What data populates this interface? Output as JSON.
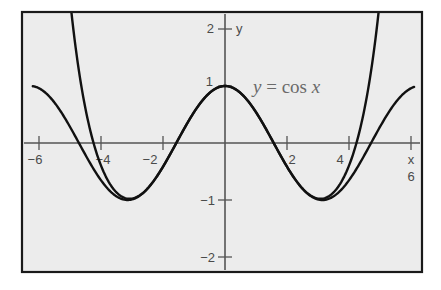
{
  "chart_data": {
    "type": "line",
    "title": "",
    "xlabel": "x",
    "ylabel": "y",
    "xlim": [
      -6.3,
      6.3
    ],
    "ylim": [
      -2.3,
      2.3
    ],
    "grid": false,
    "x_ticks": [
      -6,
      -4,
      -2,
      2,
      4,
      6
    ],
    "x_tick_labels": [
      "−6",
      "−4",
      "−2",
      "2",
      "4",
      "6"
    ],
    "y_ticks": [
      2,
      1,
      -1,
      -2
    ],
    "y_tick_labels": [
      "2",
      "1",
      "−1",
      "−2"
    ],
    "annotations": [
      {
        "text": "y = cos x",
        "x": 2.9,
        "y": 0.85
      }
    ],
    "series": [
      {
        "name": "y = cos x",
        "function": "cos(x)",
        "x_range": [
          -6.2,
          6.1
        ],
        "sample_points": [
          [
            -6,
            0.96
          ],
          [
            -5,
            0.28
          ],
          [
            -4,
            -0.65
          ],
          [
            -3.14,
            -1.0
          ],
          [
            -2,
            -0.42
          ],
          [
            -1,
            0.54
          ],
          [
            0,
            1.0
          ],
          [
            1,
            0.54
          ],
          [
            2,
            -0.42
          ],
          [
            3.14,
            -1.0
          ],
          [
            4,
            -0.65
          ],
          [
            5,
            0.28
          ],
          [
            6,
            0.96
          ]
        ]
      },
      {
        "name": "Taylor polynomial approximation (degree 8)",
        "function": "1 - x^2/2 + x^4/24 - x^6/720 + x^8/40320",
        "x_range": [
          -5.2,
          5.2
        ],
        "sample_points": [
          [
            -5,
            2.3
          ],
          [
            -4.4,
            0.0
          ],
          [
            -4,
            -0.59
          ],
          [
            -3.14,
            -0.98
          ],
          [
            -2,
            -0.42
          ],
          [
            0,
            1.0
          ],
          [
            2,
            -0.42
          ],
          [
            3.14,
            -0.98
          ],
          [
            4,
            -0.59
          ],
          [
            4.4,
            0.0
          ],
          [
            5,
            2.3
          ]
        ]
      }
    ]
  },
  "labels": {
    "x_axis": "x",
    "y_axis": "y",
    "annotation": "y = cos x",
    "x_ticks": [
      "−6",
      "−4",
      "−2",
      "2",
      "4",
      "6"
    ],
    "y_ticks": [
      "2",
      "1",
      "−1",
      "−2"
    ]
  },
  "colors": {
    "background": "#ececec",
    "frame": "#1a1a1a",
    "curve": "#111111",
    "axis": "#555555",
    "label": "#4a4a4a"
  }
}
